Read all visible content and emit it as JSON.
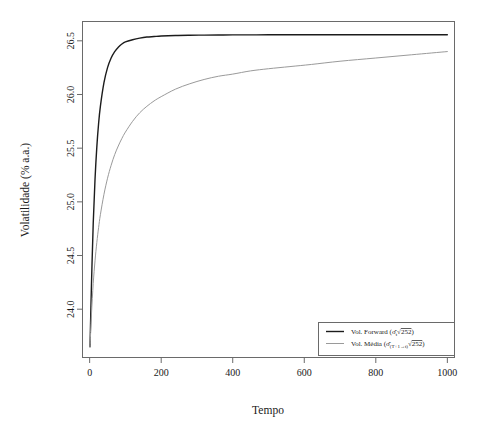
{
  "chart_data": {
    "type": "line",
    "title": "",
    "xlabel": "Tempo",
    "ylabel": "Volatilidade (% a.a.)",
    "xlim": [
      -20,
      1020
    ],
    "ylim": [
      23.55,
      26.68
    ],
    "xticks": [
      0,
      200,
      400,
      600,
      800,
      1000
    ],
    "yticks": [
      24.0,
      24.5,
      25.0,
      25.5,
      26.0,
      26.5
    ],
    "xtick_labels": [
      "0",
      "200",
      "400",
      "600",
      "800",
      "1000"
    ],
    "ytick_labels": [
      "24.0",
      "24.5",
      "25.0",
      "25.5",
      "26.0",
      "26.5"
    ],
    "grid": false,
    "legend_position": "bottom-right",
    "x": [
      1,
      5,
      10,
      15,
      20,
      25,
      30,
      40,
      50,
      60,
      70,
      80,
      90,
      100,
      120,
      140,
      160,
      180,
      200,
      240,
      280,
      320,
      360,
      400,
      450,
      500,
      560,
      620,
      700,
      800,
      900,
      1000
    ],
    "series": [
      {
        "name": "Vol. Forward",
        "label_plain": "Vol. Forward (σ̂_t √252)",
        "label_parts": {
          "text": "Vol. Forward",
          "paren_open": "(",
          "sigma": "σ̂",
          "subscript": "t",
          "radical": "√",
          "radicand": "252",
          "paren_close": ")"
        },
        "color": "#1c1c1c",
        "width": 1.4,
        "values": [
          23.65,
          24.22,
          24.8,
          25.21,
          25.51,
          25.73,
          25.89,
          26.11,
          26.25,
          26.34,
          26.4,
          26.44,
          26.47,
          26.49,
          26.51,
          26.525,
          26.535,
          26.54,
          26.545,
          26.55,
          26.552,
          26.553,
          26.554,
          26.555,
          26.555,
          26.556,
          26.556,
          26.556,
          26.557,
          26.557,
          26.557,
          26.557
        ]
      },
      {
        "name": "Vol. Média",
        "label_plain": "Vol. Média (σ̂_(T+1→t) √252)",
        "label_parts": {
          "text": "Vol. Média",
          "paren_open": "(",
          "sigma": "σ̂",
          "subscript": "(T+1→t)",
          "radical": "√",
          "radicand": "252",
          "paren_close": ")"
        },
        "color": "#9a9a9a",
        "width": 1.0,
        "values": [
          23.65,
          23.95,
          24.24,
          24.45,
          24.62,
          24.76,
          24.88,
          25.07,
          25.22,
          25.34,
          25.44,
          25.52,
          25.59,
          25.65,
          25.75,
          25.83,
          25.89,
          25.94,
          25.98,
          26.05,
          26.1,
          26.14,
          26.17,
          26.19,
          26.22,
          26.24,
          26.26,
          26.28,
          26.31,
          26.34,
          26.37,
          26.4
        ]
      }
    ]
  },
  "figure": {
    "background": "#ffffff",
    "frame_color": "#6a6a6a",
    "text_color": "#1a1a1a"
  }
}
